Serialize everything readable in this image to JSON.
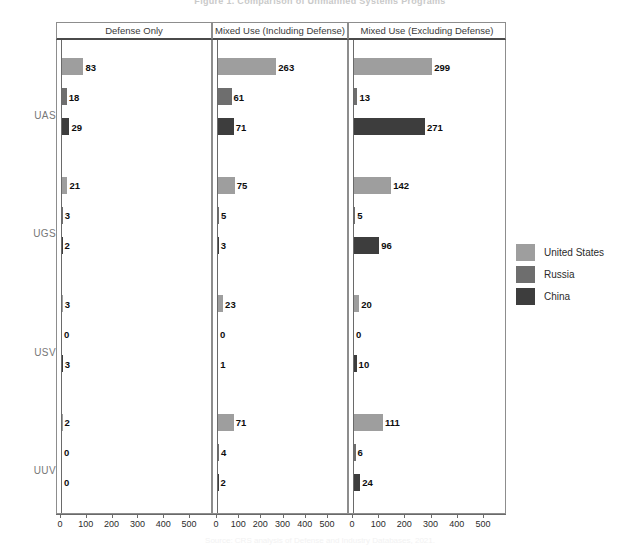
{
  "figure": {
    "title": "Figure 1. Comparison of Unmanned Systems Programs",
    "caption": "Source: CRS analysis of Defense and Industry Databases, 2021."
  },
  "legend": {
    "position": "right",
    "entries": [
      {
        "label": "United States",
        "color": "#9e9e9e",
        "key": "us"
      },
      {
        "label": "Russia",
        "color": "#6e6e6e",
        "key": "russia"
      },
      {
        "label": "China",
        "color": "#3d3d3d",
        "key": "china"
      }
    ]
  },
  "axis": {
    "categories": [
      "UAS",
      "UGS",
      "USV",
      "UUV"
    ],
    "ticks": [
      0,
      100,
      200,
      300,
      400,
      500
    ],
    "tick_labels": [
      "0",
      "100",
      "200",
      "300",
      "400",
      "500"
    ],
    "xlim": [
      0,
      550
    ],
    "grid": false
  },
  "chart_data": {
    "type": "bar",
    "title": "Figure 1. Comparison of Unmanned Systems Programs",
    "xlabel": "",
    "ylabel": "",
    "orientation": "horizontal",
    "categories": [
      "UAS",
      "UGS",
      "USV",
      "UUV"
    ],
    "xlim": [
      0,
      550
    ],
    "ticks": [
      0,
      100,
      200,
      300,
      400,
      500
    ],
    "grid": false,
    "legend_position": "right",
    "panels": [
      {
        "title": "Defense Only",
        "series": [
          {
            "name": "United States",
            "color": "#9e9e9e",
            "values": [
              83,
              21,
              3,
              2
            ]
          },
          {
            "name": "Russia",
            "color": "#6e6e6e",
            "values": [
              18,
              3,
              0,
              0
            ]
          },
          {
            "name": "China",
            "color": "#3d3d3d",
            "values": [
              29,
              2,
              3,
              0
            ]
          }
        ]
      },
      {
        "title": "Mixed Use (Including Defense)",
        "series": [
          {
            "name": "United States",
            "color": "#9e9e9e",
            "values": [
              263,
              75,
              23,
              71
            ]
          },
          {
            "name": "Russia",
            "color": "#6e6e6e",
            "values": [
              61,
              5,
              0,
              4
            ]
          },
          {
            "name": "China",
            "color": "#3d3d3d",
            "values": [
              71,
              3,
              1,
              2
            ]
          }
        ]
      },
      {
        "title": "Mixed Use (Excluding Defense)",
        "series": [
          {
            "name": "United States",
            "color": "#9e9e9e",
            "values": [
              299,
              142,
              20,
              111
            ]
          },
          {
            "name": "Russia",
            "color": "#6e6e6e",
            "values": [
              13,
              5,
              0,
              6
            ]
          },
          {
            "name": "China",
            "color": "#3d3d3d",
            "values": [
              271,
              96,
              10,
              24
            ]
          }
        ]
      }
    ]
  },
  "layout": {
    "panels": [
      {
        "left": 56,
        "width": 156
      },
      {
        "left": 212,
        "width": 136
      },
      {
        "left": 348,
        "width": 158
      }
    ]
  }
}
